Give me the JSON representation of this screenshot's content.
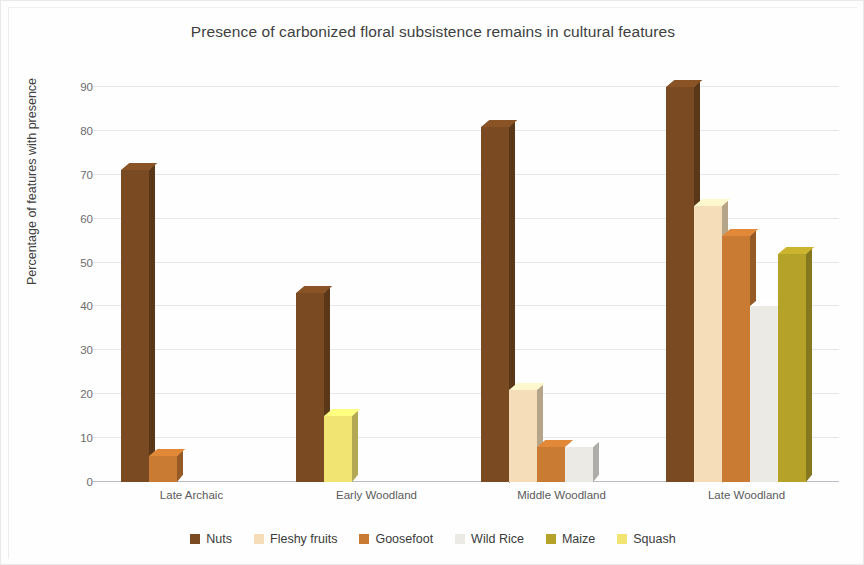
{
  "chart_data": {
    "type": "bar",
    "title": "Presence of carbonized floral subsistence remains in cultural features",
    "xlabel": "",
    "ylabel": "Percentage of features with presence",
    "categories": [
      "Late Archaic",
      "Early Woodland",
      "Middle Woodland",
      "Late Woodland"
    ],
    "ylim": [
      0,
      90
    ],
    "yticks": [
      0,
      10,
      20,
      30,
      40,
      50,
      60,
      70,
      80,
      90
    ],
    "grid": true,
    "legend_position": "bottom",
    "series": [
      {
        "name": "Nuts",
        "color": "#7a4a22",
        "values": [
          71,
          43,
          81,
          90
        ]
      },
      {
        "name": "Fleshy fruits",
        "color": "#f4ddb8",
        "values": [
          0,
          0,
          21,
          63
        ]
      },
      {
        "name": "Goosefoot",
        "color": "#c97a33",
        "values": [
          6,
          0,
          8,
          56
        ]
      },
      {
        "name": "Wild Rice",
        "color": "#eceae4",
        "values": [
          0,
          0,
          8,
          40
        ]
      },
      {
        "name": "Maize",
        "color": "#b5a229",
        "values": [
          0,
          0,
          0,
          52
        ]
      },
      {
        "name": "Squash",
        "color": "#f2e472",
        "values": [
          0,
          15,
          0,
          0
        ]
      }
    ]
  }
}
